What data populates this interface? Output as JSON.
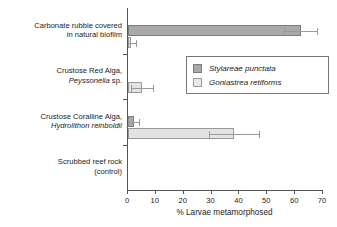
{
  "chart_data": {
    "type": "bar",
    "orientation": "horizontal",
    "title": "",
    "xlabel": "% Larvae metamorphosed",
    "ylabel": "",
    "xlim": [
      0,
      70
    ],
    "xticks": [
      0,
      10,
      20,
      30,
      40,
      50,
      60,
      70
    ],
    "xtick_labels": [
      "0",
      "10",
      "20",
      "30",
      "40",
      "50",
      "60",
      "70"
    ],
    "grid": false,
    "legend_position": "center-right",
    "categories": [
      "Carbonate rubble covered in natural biofilm",
      "Crustose Red Alga, Peyssonelia sp.",
      "Crustose Coralline Alga, Hydrolithon reinboldii",
      "Scrubbed reef rock (control)"
    ],
    "category_lines": [
      [
        {
          "text": "Carbonate rubble covered",
          "italic": false
        },
        {
          "text": "in natural biofilm",
          "italic": false
        }
      ],
      [
        {
          "text": "Crustose Red Alga,",
          "italic": false
        },
        {
          "text": "Peyssonelia",
          "italic": true,
          "suffix": " sp."
        }
      ],
      [
        {
          "text": "Crustose Coralline Alga,",
          "italic": false
        },
        {
          "text": "Hydrolithon reinboldii",
          "italic": true
        }
      ],
      [
        {
          "text": "Scrubbed reef rock",
          "italic": false
        },
        {
          "text": "(control)",
          "italic": false
        }
      ]
    ],
    "series": [
      {
        "name": "Stylareae punctata",
        "color": "#a9a9a9",
        "values": [
          62,
          0,
          2,
          0
        ],
        "errors": [
          6,
          0,
          2,
          0
        ]
      },
      {
        "name": "Goniastrea retiforms",
        "color": "#e3e3e3",
        "values": [
          1,
          5,
          38,
          0
        ],
        "errors": [
          2,
          4,
          9,
          0
        ]
      }
    ]
  },
  "legend": {
    "entries": [
      {
        "label": "Stylareae punctata",
        "swatch": "series-a"
      },
      {
        "label": "Goniastrea retiforms",
        "swatch": "series-b"
      }
    ]
  },
  "axis": {
    "x_title": "% Larvae metamorphosed"
  },
  "colors": {
    "series_a": "#a9a9a9",
    "series_b": "#e3e3e3",
    "axis": "#555555",
    "error": "#9a9a9a",
    "text": "#1b1b1b",
    "background": "#ffffff"
  }
}
